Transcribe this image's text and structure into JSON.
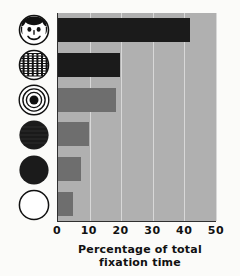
{
  "chart_data": {
    "type": "bar",
    "orientation": "horizontal",
    "title": "",
    "xlabel_lines": [
      "Percentage of total",
      "fixation time"
    ],
    "ylabel": "",
    "xlim": [
      0,
      50
    ],
    "xticks": [
      0,
      10,
      20,
      30,
      40,
      50
    ],
    "xtick_labels": [
      "0",
      "10",
      "20",
      "30",
      "40",
      "50"
    ],
    "grid": true,
    "legend": "none",
    "plot_background": "#b0b0b0",
    "categories": [
      "smiling-face",
      "scrambled-face",
      "bullseye-concentric-circles",
      "textured-dark-disc",
      "solid-dark-disc",
      "empty-outline-circle"
    ],
    "values": [
      41.8,
      19.5,
      18.4,
      9.8,
      7.3,
      4.6
    ],
    "bar_colors": [
      "#1b1b1b",
      "#1b1b1b",
      "#6e6e6e",
      "#6e6e6e",
      "#6e6e6e",
      "#6e6e6e"
    ]
  },
  "axis": {
    "tick_labels": [
      "0",
      "10",
      "20",
      "30",
      "40",
      "50"
    ],
    "title_line1": "Percentage of total",
    "title_line2": "fixation time"
  },
  "icons": [
    {
      "name": "smiling-face-icon",
      "label": "smiling face"
    },
    {
      "name": "scrambled-face-icon",
      "label": "scrambled face"
    },
    {
      "name": "bullseye-icon",
      "label": "concentric circles"
    },
    {
      "name": "textured-disc-icon",
      "label": "textured dark disc"
    },
    {
      "name": "solid-disc-icon",
      "label": "solid dark disc"
    },
    {
      "name": "outline-circle-icon",
      "label": "empty outline circle"
    }
  ]
}
